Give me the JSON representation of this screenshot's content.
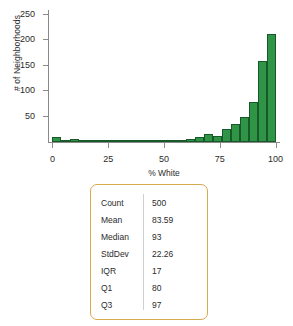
{
  "chart_data": {
    "type": "bar",
    "title": "",
    "xlabel": "% White",
    "ylabel": "# of Neighborhoods",
    "xlim": [
      -2,
      102
    ],
    "ylim": [
      0,
      260
    ],
    "grid": false,
    "legend": "none",
    "bin_width": 4,
    "bar_color": "#2f9445",
    "bar_edge_color": "#17592a",
    "xticks": [
      "0",
      "25",
      "50",
      "75",
      "100"
    ],
    "xtick_values": [
      0,
      25,
      50,
      75,
      100
    ],
    "yticks": [
      "50",
      "100",
      "150",
      "200",
      "250"
    ],
    "ytick_values": [
      50,
      100,
      150,
      200,
      250
    ],
    "categories": [
      "0-4",
      "4-8",
      "8-12",
      "12-16",
      "16-20",
      "20-24",
      "24-28",
      "28-32",
      "32-36",
      "36-40",
      "40-44",
      "44-48",
      "48-52",
      "52-56",
      "56-60",
      "60-64",
      "64-68",
      "68-72",
      "72-76",
      "76-80",
      "80-84",
      "84-88",
      "88-92",
      "92-96",
      "96-100"
    ],
    "bin_starts": [
      0,
      4,
      8,
      12,
      16,
      20,
      24,
      28,
      32,
      36,
      40,
      44,
      48,
      52,
      56,
      60,
      64,
      68,
      72,
      76,
      80,
      84,
      88,
      92,
      96
    ],
    "values": [
      10,
      3,
      5,
      1,
      2,
      2,
      2,
      1,
      1,
      1,
      1,
      1,
      3,
      4,
      4,
      5,
      10,
      16,
      12,
      26,
      35,
      50,
      78,
      160,
      212
    ]
  },
  "summary": {
    "border_color": "#d6ab4e",
    "rows": [
      {
        "label": "Count",
        "value": "500"
      },
      {
        "label": "Mean",
        "value": "83.59"
      },
      {
        "label": "Median",
        "value": "93"
      },
      {
        "label": "StdDev",
        "value": "22.26"
      },
      {
        "label": "IQR",
        "value": "17"
      },
      {
        "label": "Q1",
        "value": "80"
      },
      {
        "label": "Q3",
        "value": "97"
      }
    ]
  }
}
